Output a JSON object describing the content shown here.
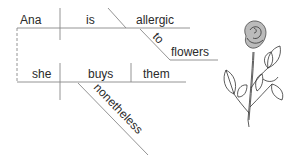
{
  "diagram": {
    "type": "sentence-diagram",
    "clause1": {
      "subject": "Ana",
      "verb": "is",
      "complement": "allergic",
      "preposition": "to",
      "object_of_preposition": "flowers"
    },
    "clause2": {
      "subject": "she",
      "verb": "buys",
      "object": "them",
      "adverb": "nonetheless"
    },
    "connector_style": "dashed",
    "illustration": "rose"
  }
}
